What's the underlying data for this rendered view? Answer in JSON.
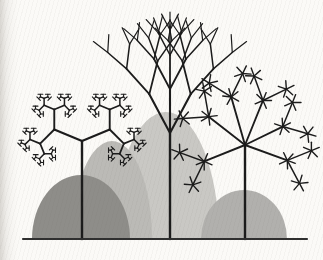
{
  "figure": {
    "type": "fractal-trees-illustration",
    "background_color": "#fbfaf7",
    "ink_color": "#1b1b1b",
    "canvas": {
      "width": 323,
      "height": 260
    },
    "ground_line": {
      "x1": 23,
      "x2": 307,
      "y": 239,
      "color": "#2f2f2f",
      "stroke_width": 2.2
    },
    "mounds": [
      {
        "name": "middle-light-dome",
        "cx": 166,
        "rx": 53,
        "ry": 127,
        "fill": "#c9c8c4"
      },
      {
        "name": "left-inner-mound",
        "cx": 112,
        "rx": 40,
        "ry": 98,
        "fill": "#bbbab6"
      },
      {
        "name": "right-mound",
        "cx": 244,
        "rx": 43,
        "ry": 49,
        "fill": "#b1b0ad"
      },
      {
        "name": "left-dark-mound",
        "cx": 81,
        "rx": 49,
        "ry": 64,
        "fill": "#8e8d89"
      }
    ],
    "trees": {
      "left": {
        "name": "right-angle-fractal-tree",
        "trunk_x": 82,
        "trunk_top": 141,
        "trunk_width": 2.4,
        "branch_angle": 67.5,
        "lengths": [
          30,
          20,
          11,
          7,
          4,
          2.6
        ],
        "widths": [
          2.1,
          1.9,
          1.7,
          1.5,
          1.3,
          1.1
        ],
        "tip_cap": 2.4
      },
      "middle": {
        "name": "binary-canopy-tree",
        "trunk_x": 170,
        "trunk_top": 133,
        "trunk_width": 2.4,
        "delta": 28,
        "curl": 0.5,
        "lengths": [
          44,
          34,
          25,
          18
        ],
        "widths": [
          2.1,
          1.8,
          1.5,
          1.2
        ]
      },
      "right": {
        "name": "star-burst-tree",
        "trunk_x": 245,
        "trunk_top": 145,
        "trunk_width": 2.4,
        "primary_angles": [
          -52,
          -16,
          22,
          64,
          110,
          -112
        ],
        "primary_lengths": [
          46,
          50,
          48,
          42,
          45,
          44
        ],
        "primary_width": 1.9,
        "secondary_offset": 42,
        "secondary_length": 26,
        "secondary_width": 1.5,
        "spoke_length": 8.5,
        "spoke_offsets": [
          -135,
          -68,
          0,
          68,
          135
        ],
        "spoke_width": 1.4
      }
    }
  }
}
